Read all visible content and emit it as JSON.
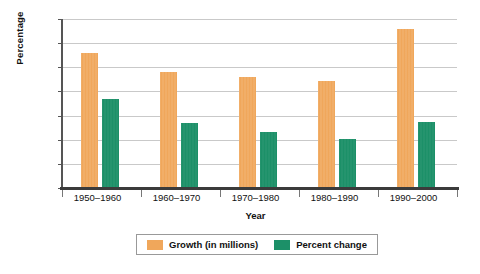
{
  "chart_data": {
    "type": "bar",
    "title": "",
    "subtitle": "",
    "xlabel": "Year",
    "ylabel": "Percentage",
    "categories": [
      "1950–1960",
      "1960–1970",
      "1970–1980",
      "1980–1990",
      "1990–2000"
    ],
    "series": [
      {
        "name": "Growth (in millions)",
        "color": "#F0A75B",
        "values": [
          28,
          24,
          23,
          22.2,
          33
        ]
      },
      {
        "name": "Percent change",
        "color": "#1C9068",
        "values": [
          18.5,
          13.5,
          11.6,
          10.1,
          13.6
        ]
      }
    ],
    "ylim": [
      0,
      35
    ],
    "yticks": [
      0,
      5,
      10,
      15,
      20,
      25,
      30,
      35
    ],
    "ytick_labels": [
      "0",
      "5",
      "10",
      "15",
      "20",
      "25",
      "30",
      "35"
    ],
    "grid": true,
    "grid_axis": "y",
    "legend_position": "bottom",
    "bar_orientation": "vertical",
    "grouping": "grouped"
  },
  "legend": {
    "entries": [
      {
        "label": "Growth (in millions)"
      },
      {
        "label": "Percent change"
      }
    ]
  }
}
